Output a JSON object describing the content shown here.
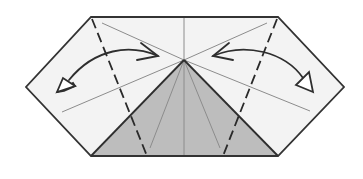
{
  "diagram": {
    "title": "Origami fold step: hexagon with flaps folded to center and unfolded",
    "colors": {
      "paper": "#f2f2f2",
      "shaded": "#b8b8b8",
      "outline": "#333333",
      "crease": "#8a8a8a",
      "arrow": "#333333"
    },
    "elements": {
      "outline": "hexagon-paper-outline",
      "shaded_region": "triangle-colored-side",
      "valley_folds": [
        "left-valley-fold",
        "right-valley-fold"
      ],
      "arrows": [
        "fold-and-unfold-left",
        "fold-and-unfold-right"
      ]
    }
  }
}
